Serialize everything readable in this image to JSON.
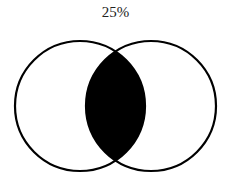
{
  "diagram": {
    "type": "venn",
    "label": "25%",
    "sets": [
      "A",
      "B"
    ],
    "shaded_region": "intersection",
    "colors": {
      "stroke": "#000000",
      "fill": "#000000",
      "background": "#ffffff"
    }
  }
}
